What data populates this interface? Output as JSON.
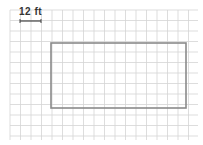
{
  "diagram": {
    "scale": {
      "label": "12 ft",
      "x1": 20,
      "x2": 41,
      "y": 21
    },
    "grid": {
      "x0": 10,
      "y0": 10,
      "x1": 198,
      "y1": 140,
      "spacing": 10.5,
      "color": "#d4d4d4"
    },
    "rectangle": {
      "x": 51,
      "y": 43,
      "width": 135,
      "height": 65,
      "stroke": "#8a8a8a",
      "width_cells": 13,
      "height_cells": 6
    }
  }
}
